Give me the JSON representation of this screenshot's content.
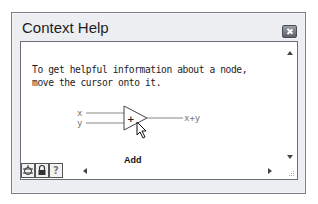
{
  "window": {
    "title": "Context Help",
    "close_icon": "close-icon"
  },
  "content": {
    "description_line1": "To get helpful information about a node,",
    "description_line2": "move the cursor onto it.",
    "diagram": {
      "input_x": "x",
      "input_y": "y",
      "operator": "+",
      "output": "x+y",
      "node_name": "Add"
    }
  },
  "bottom_toolbar": {
    "buttons": [
      {
        "icon": "show-optional-terminals-icon",
        "glyph": "⊕"
      },
      {
        "icon": "lock-icon",
        "glyph": "🔒"
      },
      {
        "icon": "help-icon",
        "glyph": "?"
      }
    ]
  },
  "colors": {
    "window_bg": "#eceef2",
    "panel_bg": "#ffffff",
    "border": "#6c6f76"
  }
}
